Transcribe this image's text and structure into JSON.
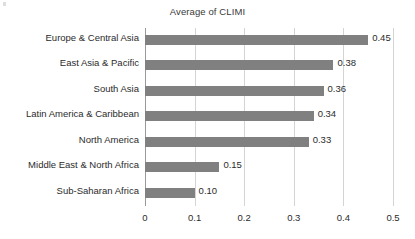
{
  "chart_data": {
    "type": "bar",
    "orientation": "horizontal",
    "title": "Average of CLIMI",
    "xlabel": "",
    "ylabel": "",
    "xlim": [
      0,
      0.5
    ],
    "xticks": [
      "0",
      "0.1",
      "0.2",
      "0.3",
      "0.4",
      "0.5"
    ],
    "xtick_values": [
      0,
      0.1,
      0.2,
      0.3,
      0.4,
      0.5
    ],
    "grid": true,
    "legend": false,
    "bar_color": "#808080",
    "gridline_color": "#d4d4d4",
    "axis_color": "#9a9a9a",
    "text_color": "#2b2b2b",
    "categories": [
      "Europe & Central Asia",
      "East Asia & Pacific",
      "South Asia",
      "Latin America & Caribbean",
      "North America",
      "Middle East & North Africa",
      "Sub-Saharan Africa"
    ],
    "values": [
      0.45,
      0.38,
      0.36,
      0.34,
      0.33,
      0.15,
      0.1
    ],
    "value_labels": [
      "0.45",
      "0.38",
      "0.36",
      "0.34",
      "0.33",
      "0.15",
      "0.10"
    ]
  }
}
